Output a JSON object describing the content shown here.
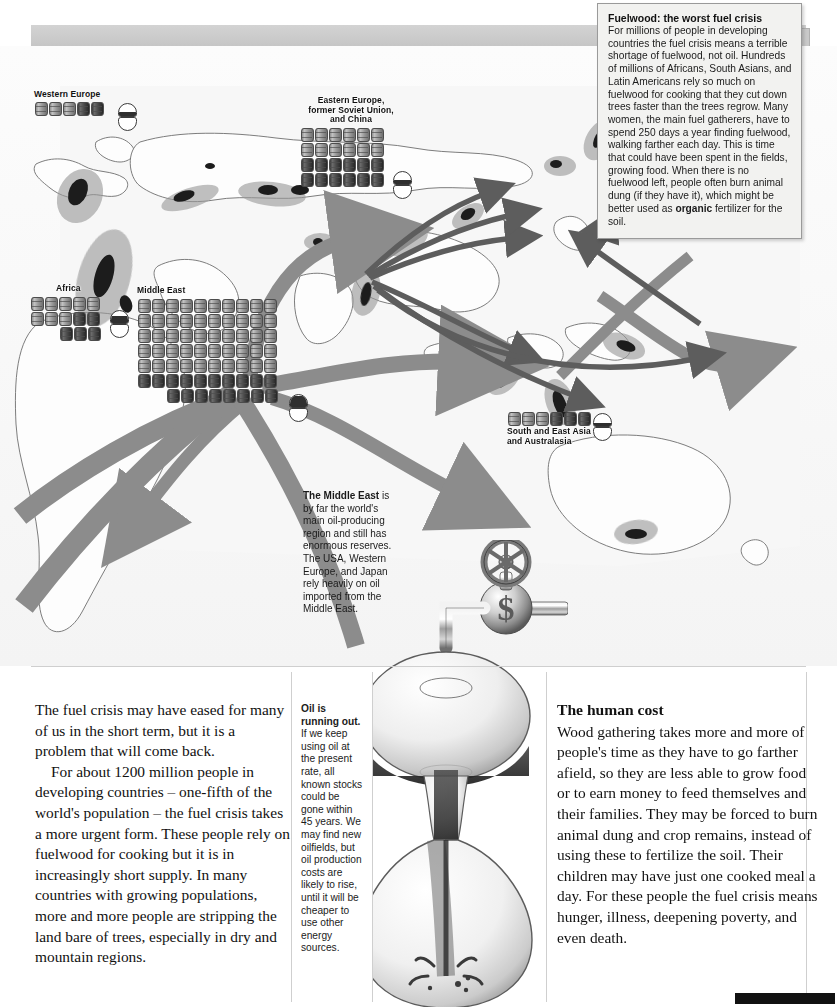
{
  "document": {
    "title": "Fuelwood: the worst fuel crisis",
    "kind": "illustrated-textbook-spread"
  },
  "infobox": {
    "heading": "Fuelwood: the worst fuel crisis",
    "body_before_bold": "For millions of people in developing countries the fuel crisis means a terrible shortage of fuelwood, not oil. Hundreds of millions of Africans, South Asians, and Latin Americans rely so much on fuelwood for cooking that they cut down trees faster than the trees regrow. Many women, the main fuel gatherers, have to spend 250 days a year finding fuelwood, walking farther each day. This is time that could have been spent in the fields, growing food. When there is no fuelwood left, people often burn animal dung (if they have it), which might be better used as ",
    "bold_term": "organic",
    "body_after_bold": " fertilizer for the soil."
  },
  "map": {
    "caption_middle_east": {
      "bold_lead": "The Middle East",
      "rest": " is by far the world's main oil-producing region and still has enormous reserves. The USA, Western Europe, and Japan rely heavily on oil imported from the Middle East."
    },
    "regions": [
      {
        "id": "western-europe",
        "label": "Western Europe",
        "barrels": 5,
        "per_row": 5,
        "dark_from": 3,
        "reserve_fill_pct": 35
      },
      {
        "id": "eastern-europe",
        "label": "Eastern Europe,\nformer Soviet Union,\nand China",
        "barrels": 24,
        "per_row": 6,
        "dark_from": 12,
        "reserve_fill_pct": 30
      },
      {
        "id": "africa",
        "label": "Africa",
        "barrels": 13,
        "per_row": 5,
        "dark_from": 8,
        "reserve_fill_pct": 55
      },
      {
        "id": "middle-east",
        "label": "Middle East",
        "barrels": 68,
        "per_row": 10,
        "dark_from": 50,
        "reserve_fill_pct": 92
      },
      {
        "id": "south-east-asia",
        "label": "South and East Asia\nand Australasia",
        "barrels": 6,
        "per_row": 6,
        "dark_from": 3,
        "reserve_fill_pct": 25
      }
    ],
    "legend_note": "Each barrel symbol represents oil consumption; the hourglass symbol shows remaining reserves."
  },
  "bottom": {
    "left_column": {
      "para1": "The fuel crisis may have eased for many of us in the short term, but it is a problem that will come back.",
      "para2": "For about 1200 million people in developing countries – one-fifth of the world's population – the fuel crisis takes a more urgent form. These people rely on fuelwood for cooking but it is in increasingly short supply. In many countries with growing populations, more and more people are stripping the land bare of trees, especially in dry and mountain regions."
    },
    "middle_column": {
      "bold_lead": "Oil is running out.",
      "rest": " If we keep using oil at the present rate, all known stocks could be gone within 45 years. We may find new oilfields, but oil production costs are likely to rise, until it will be cheaper to use other energy sources."
    },
    "right_column": {
      "heading": "The human cost",
      "body": "Wood gathering takes more and more of people's time as they have to go farther afield, so they are less able to grow food or to earn money to feed themselves and their families. They may be forced to burn animal dung and crop remains, instead of using these to fertilize the soil. Their children may have just one cooked meal a day. For these people the fuel crisis means hunger, illness, deepening poverty, and even death."
    }
  },
  "illustration": {
    "name": "dollar-tap-dripping-into-hourglass",
    "tap_symbol": "$",
    "description": "A valve/tap marked with a dollar sign drips oil into a glass hourglass."
  },
  "colors": {
    "page_background": "#ffffff",
    "header_strip": "#d3d3d3",
    "infobox_background": "#f2f2f0",
    "infobox_border": "#9a9a9a",
    "arrow_gray": "#8c8c8c",
    "arrow_dark_gray": "#5d5d5d",
    "land_outline": "#6e6e6e",
    "barrel_dark": "#3a3a3a",
    "text": "#111111"
  }
}
